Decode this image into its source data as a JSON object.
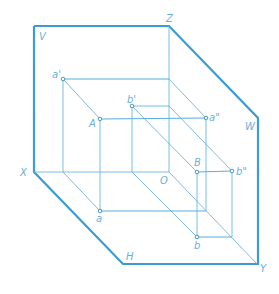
{
  "diagram": {
    "colors": {
      "frame": "#3a9bd5",
      "lines": "#6ab8e2",
      "labels": "#6ab0d8"
    },
    "plane_labels": {
      "V": "V",
      "W": "W",
      "H": "H"
    },
    "axis_labels": {
      "X": "X",
      "Y": "Y",
      "Z": "Z",
      "O": "O"
    },
    "points": [
      {
        "id": "A",
        "label": "A",
        "projections": {
          "V": "a'",
          "W": "a\"",
          "H": "a"
        }
      },
      {
        "id": "B",
        "label": "B",
        "projections": {
          "V": "b'",
          "W": "b\"",
          "H": "b"
        }
      }
    ],
    "labels": {
      "a_prime": "a'",
      "a_dprime": "a\"",
      "a": "a",
      "A": "A",
      "b_prime": "b'",
      "b_dprime": "b\"",
      "b": "b",
      "B": "B"
    }
  }
}
